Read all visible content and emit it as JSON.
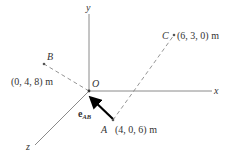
{
  "axes": {
    "x_label": "x",
    "y_label": "y",
    "z_label": "z",
    "origin_label": "O"
  },
  "points": {
    "A": {
      "name": "A",
      "coords": "(4, 0, 6) m"
    },
    "B": {
      "name": "B",
      "coords": "(0, 4, 8) m"
    },
    "C": {
      "name": "C",
      "coords": "(6, 3, 0) m"
    }
  },
  "vector": {
    "symbol": "e",
    "subscript": "AB"
  },
  "colors": {
    "axis": "#8a8a8a",
    "dashed": "#7a7a7a",
    "arrow": "#000000",
    "text": "#333333"
  }
}
